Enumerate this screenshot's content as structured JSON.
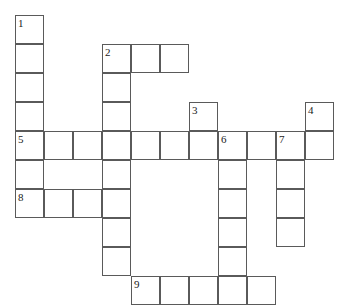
{
  "puzzle": {
    "kind": "crossword-grid",
    "title": "",
    "cell_size": 29,
    "origin_x": 15,
    "origin_y": 15,
    "colors": {
      "cell_border": "#5a5a5a",
      "cell_fill": "#ffffff",
      "number_text": "#1a1a1a",
      "page_background": "#ffffff"
    },
    "numbers": [
      {
        "label": "1",
        "col": 0,
        "row": 0
      },
      {
        "label": "2",
        "col": 3,
        "row": 1
      },
      {
        "label": "3",
        "col": 6,
        "row": 3
      },
      {
        "label": "4",
        "col": 10,
        "row": 3
      },
      {
        "label": "5",
        "col": 0,
        "row": 4
      },
      {
        "label": "6",
        "col": 7,
        "row": 4
      },
      {
        "label": "7",
        "col": 9,
        "row": 4
      },
      {
        "label": "8",
        "col": 0,
        "row": 6
      },
      {
        "label": "9",
        "col": 4,
        "row": 9
      }
    ],
    "entries": [
      {
        "number": "1",
        "direction": "down",
        "col": 0,
        "row": 0,
        "length": 5
      },
      {
        "number": "2",
        "direction": "across",
        "col": 3,
        "row": 1,
        "length": 3
      },
      {
        "number": "2",
        "direction": "down",
        "col": 3,
        "row": 1,
        "length": 9
      },
      {
        "number": "3",
        "direction": "down",
        "col": 6,
        "row": 3,
        "length": 2
      },
      {
        "number": "4",
        "direction": "down",
        "col": 10,
        "row": 3,
        "length": 2
      },
      {
        "number": "5",
        "direction": "across",
        "col": 0,
        "row": 4,
        "length": 11
      },
      {
        "number": "6",
        "direction": "down",
        "col": 7,
        "row": 4,
        "length": 6
      },
      {
        "number": "7",
        "direction": "down",
        "col": 9,
        "row": 4,
        "length": 4
      },
      {
        "number": "8",
        "direction": "across",
        "col": 0,
        "row": 6,
        "length": 3
      },
      {
        "number": "9",
        "direction": "across",
        "col": 4,
        "row": 9,
        "length": 5
      }
    ],
    "cells": [
      {
        "col": 0,
        "row": 0,
        "number": "1",
        "letter": ""
      },
      {
        "col": 0,
        "row": 1,
        "number": "",
        "letter": ""
      },
      {
        "col": 0,
        "row": 2,
        "number": "",
        "letter": ""
      },
      {
        "col": 0,
        "row": 3,
        "number": "",
        "letter": ""
      },
      {
        "col": 3,
        "row": 1,
        "number": "2",
        "letter": ""
      },
      {
        "col": 4,
        "row": 1,
        "number": "",
        "letter": ""
      },
      {
        "col": 5,
        "row": 1,
        "number": "",
        "letter": ""
      },
      {
        "col": 3,
        "row": 2,
        "number": "",
        "letter": ""
      },
      {
        "col": 3,
        "row": 3,
        "number": "",
        "letter": ""
      },
      {
        "col": 6,
        "row": 3,
        "number": "3",
        "letter": ""
      },
      {
        "col": 10,
        "row": 3,
        "number": "4",
        "letter": ""
      },
      {
        "col": 0,
        "row": 4,
        "number": "5",
        "letter": ""
      },
      {
        "col": 1,
        "row": 4,
        "number": "",
        "letter": ""
      },
      {
        "col": 2,
        "row": 4,
        "number": "",
        "letter": ""
      },
      {
        "col": 3,
        "row": 4,
        "number": "",
        "letter": ""
      },
      {
        "col": 4,
        "row": 4,
        "number": "",
        "letter": ""
      },
      {
        "col": 5,
        "row": 4,
        "number": "",
        "letter": ""
      },
      {
        "col": 6,
        "row": 4,
        "number": "",
        "letter": ""
      },
      {
        "col": 7,
        "row": 4,
        "number": "6",
        "letter": ""
      },
      {
        "col": 8,
        "row": 4,
        "number": "",
        "letter": ""
      },
      {
        "col": 9,
        "row": 4,
        "number": "7",
        "letter": ""
      },
      {
        "col": 10,
        "row": 4,
        "number": "",
        "letter": ""
      },
      {
        "col": 0,
        "row": 5,
        "number": "",
        "letter": ""
      },
      {
        "col": 3,
        "row": 5,
        "number": "",
        "letter": ""
      },
      {
        "col": 7,
        "row": 5,
        "number": "",
        "letter": ""
      },
      {
        "col": 9,
        "row": 5,
        "number": "",
        "letter": ""
      },
      {
        "col": 0,
        "row": 6,
        "number": "8",
        "letter": ""
      },
      {
        "col": 1,
        "row": 6,
        "number": "",
        "letter": ""
      },
      {
        "col": 2,
        "row": 6,
        "number": "",
        "letter": ""
      },
      {
        "col": 3,
        "row": 6,
        "number": "",
        "letter": ""
      },
      {
        "col": 7,
        "row": 6,
        "number": "",
        "letter": ""
      },
      {
        "col": 9,
        "row": 6,
        "number": "",
        "letter": ""
      },
      {
        "col": 3,
        "row": 7,
        "number": "",
        "letter": ""
      },
      {
        "col": 7,
        "row": 7,
        "number": "",
        "letter": ""
      },
      {
        "col": 9,
        "row": 7,
        "number": "",
        "letter": ""
      },
      {
        "col": 3,
        "row": 8,
        "number": "",
        "letter": ""
      },
      {
        "col": 7,
        "row": 8,
        "number": "",
        "letter": ""
      },
      {
        "col": 4,
        "row": 9,
        "number": "9",
        "letter": ""
      },
      {
        "col": 5,
        "row": 9,
        "number": "",
        "letter": ""
      },
      {
        "col": 6,
        "row": 9,
        "number": "",
        "letter": ""
      },
      {
        "col": 7,
        "row": 9,
        "number": "",
        "letter": ""
      },
      {
        "col": 8,
        "row": 9,
        "number": "",
        "letter": ""
      }
    ]
  }
}
